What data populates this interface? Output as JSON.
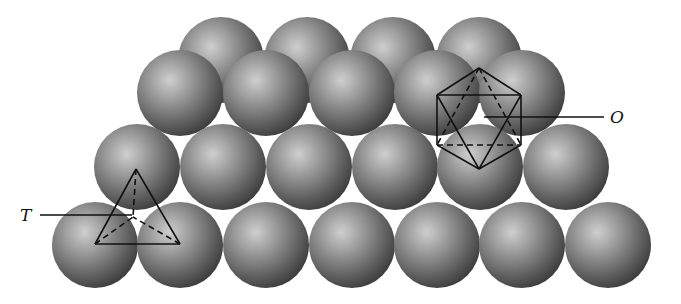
{
  "diagram": {
    "sphere_radius": 43,
    "colors": {
      "background": "#ffffff",
      "sphere_highlight": "#c9c9c9",
      "sphere_mid": "#8a8a8a",
      "sphere_shadow": "#3a3a3a",
      "line": "#111111"
    },
    "layers": [
      {
        "name": "back-layer",
        "y": 60,
        "x": [
          221,
          307,
          393,
          479
        ]
      },
      {
        "name": "upper-front-layer",
        "y": 93,
        "x": [
          180,
          266,
          352,
          437,
          522
        ]
      },
      {
        "name": "middle-layer",
        "y": 167,
        "x": [
          137,
          223,
          309,
          395,
          480,
          566
        ]
      },
      {
        "name": "bottom-layer",
        "y": 245,
        "x": [
          95,
          180,
          266,
          352,
          437,
          522,
          608
        ]
      }
    ],
    "labels": {
      "tetrahedral": "T",
      "octahedral": "O"
    },
    "tetrahedron": {
      "apex": [
        136,
        169
      ],
      "base_left": [
        95,
        244
      ],
      "base_right": [
        180,
        244
      ],
      "back": [
        133,
        217
      ]
    },
    "octahedron": {
      "top": [
        479,
        68
      ],
      "bottom": [
        479,
        169
      ],
      "upper_left": [
        437,
        95
      ],
      "upper_right": [
        521,
        95
      ],
      "lower_left": [
        437,
        145
      ],
      "lower_right": [
        521,
        145
      ]
    }
  }
}
